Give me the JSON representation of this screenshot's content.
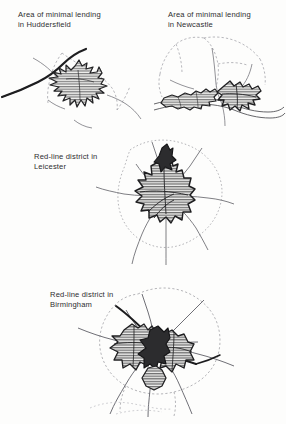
{
  "figure": {
    "background_color": "#fdfdfc",
    "ink_color": "#2b2b2d",
    "caption_color": "#2e2e30",
    "hatch_color": "#3a3a3c",
    "boundary_color": "#8d8d92"
  },
  "maps": [
    {
      "id": "huddersfield",
      "caption": "Area of minimal lending\nin Huddersfield",
      "city": "Huddersfield",
      "theme": "Area of minimal lending",
      "caption_x": 18,
      "caption_y": 10,
      "features": [
        "hatched-lending-area",
        "motorway-line",
        "district-boundary-dashed",
        "minor-roads"
      ]
    },
    {
      "id": "newcastle",
      "caption": "Area of minimal lending\nin Newcastle",
      "city": "Newcastle",
      "theme": "Area of minimal lending",
      "caption_x": 168,
      "caption_y": 10,
      "features": [
        "hatched-lending-area-north",
        "hatched-lending-area-south",
        "river-tyne",
        "district-boundary-dashed",
        "roads"
      ]
    },
    {
      "id": "leicester",
      "caption": "Red-line district in\nLeicester",
      "city": "Leicester",
      "theme": "Red-line district",
      "caption_x": 34,
      "caption_y": 152,
      "features": [
        "hatched-redline-core",
        "radial-roads",
        "city-boundary-dashed"
      ]
    },
    {
      "id": "birmingham",
      "caption": "Red-line district in\nBirmingham",
      "city": "Birmingham",
      "theme": "Red-line district",
      "caption_x": 50,
      "caption_y": 290,
      "features": [
        "hatched-redline-lobes",
        "dark-city-centre",
        "radial-roads",
        "city-boundary-dashed"
      ]
    }
  ]
}
